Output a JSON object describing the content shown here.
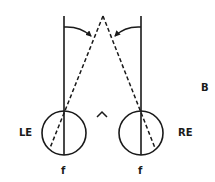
{
  "figure": {
    "panel_label": "B",
    "left_eye": {
      "label": "LE",
      "fovea_label": "f"
    },
    "right_eye": {
      "label": "RE",
      "fovea_label": "f"
    },
    "center_symbol": "^"
  },
  "colors": {
    "stroke": "#1a1a1a",
    "background": "#ffffff"
  }
}
